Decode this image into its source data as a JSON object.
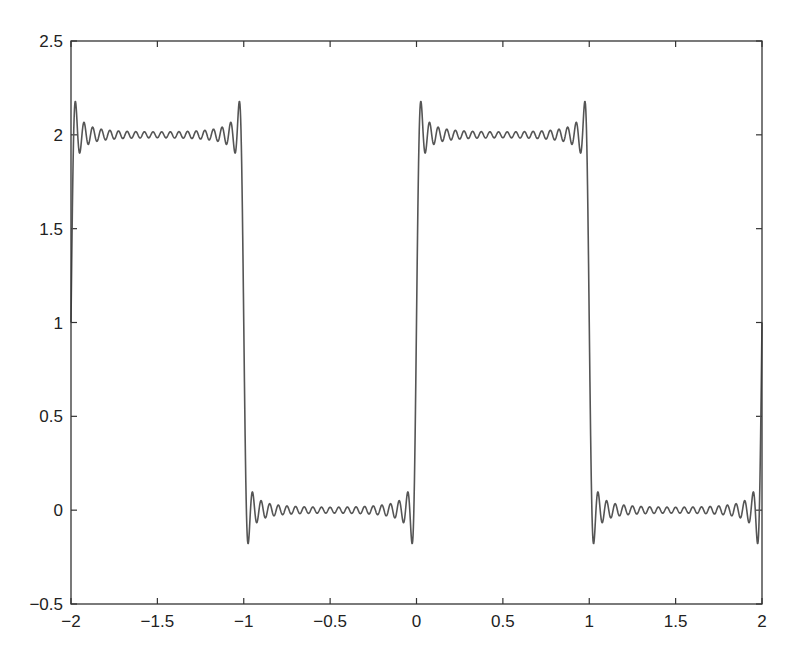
{
  "chart_data": {
    "type": "line",
    "title": "",
    "xlabel": "",
    "ylabel": "",
    "xlim": [
      -2,
      2
    ],
    "ylim": [
      -0.5,
      2.5
    ],
    "grid": false,
    "legend": null,
    "x_ticks": [
      -2,
      -1.5,
      -1,
      -0.5,
      0,
      0.5,
      1,
      1.5,
      2
    ],
    "x_tick_labels": [
      "−2",
      "−1.5",
      "−1",
      "−0.5",
      "0",
      "0.5",
      "1",
      "1.5",
      "2"
    ],
    "y_ticks": [
      -0.5,
      0,
      0.5,
      1,
      1.5,
      2,
      2.5
    ],
    "y_tick_labels": [
      "−0.5",
      "0",
      "0.5",
      "1",
      "1.5",
      "2",
      "2.5"
    ],
    "series": [
      {
        "name": "Fourier partial sum of square wave",
        "description": "f(x) = 1 + (4/pi) * sum over odd n of sin(n*pi*x)/n, showing Gibbs phenomenon",
        "offset": 1,
        "amplitude": 1,
        "period": 2,
        "highest_odd_harmonic": 39,
        "samples": 2000,
        "color": "#555555",
        "levels": {
          "high": 2,
          "low": 0
        },
        "overshoot_max": 2.18,
        "undershoot_min": -0.18,
        "intervals_high": [
          [
            -2,
            -1
          ],
          [
            0,
            1
          ]
        ],
        "intervals_low": [
          [
            -1,
            0
          ],
          [
            1,
            2
          ]
        ]
      }
    ]
  },
  "colors": {
    "axes": "#333333",
    "line": "#555555",
    "background": "#ffffff"
  }
}
